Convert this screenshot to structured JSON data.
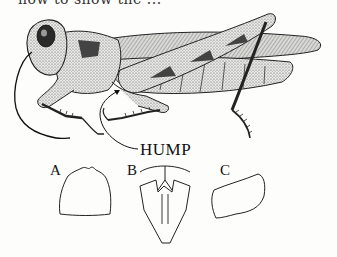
{
  "page": {
    "top_text_clipped": "how to show the ...",
    "background": "#fdfdfc",
    "ink": "#111111"
  },
  "figure": {
    "callouts": {
      "hump": "HUMP"
    },
    "details": [
      {
        "label": "A",
        "shape": "pronotum-top-outline"
      },
      {
        "label": "B",
        "shape": "prosternum-with-hump-outline"
      },
      {
        "label": "C",
        "shape": "pronotum-side-outline"
      }
    ]
  }
}
